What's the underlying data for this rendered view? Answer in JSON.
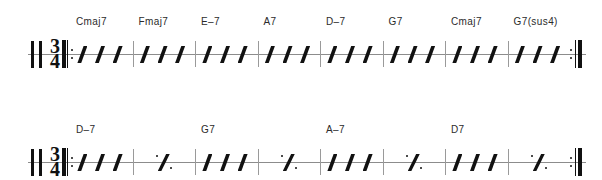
{
  "document": {
    "type": "chord-chart",
    "title": "",
    "clef": "rhythm-clef",
    "time_signature": {
      "numerator": "3",
      "denominator": "4"
    }
  },
  "colors": {
    "ink": "#111111",
    "staff_line": "#8c8c8c",
    "barline": "#9a9a9a",
    "chord_text": "#2b2b2b",
    "background": "#ffffff"
  },
  "systems": [
    {
      "name": "system-1",
      "start_repeat": true,
      "end_repeat": true,
      "measures": [
        {
          "chord": "Cmaj7",
          "content": "slashes",
          "beats": 3
        },
        {
          "chord": "Fmaj7",
          "content": "slashes",
          "beats": 3
        },
        {
          "chord": "E–7",
          "content": "slashes",
          "beats": 3
        },
        {
          "chord": "A7",
          "content": "slashes",
          "beats": 3
        },
        {
          "chord": "D–7",
          "content": "slashes",
          "beats": 3
        },
        {
          "chord": "G7",
          "content": "slashes",
          "beats": 3
        },
        {
          "chord": "Cmaj7",
          "content": "slashes",
          "beats": 3
        },
        {
          "chord": "G7(sus4)",
          "content": "slashes",
          "beats": 3
        }
      ]
    },
    {
      "name": "system-2",
      "start_repeat": true,
      "end_repeat": true,
      "measures": [
        {
          "chord": "D–7",
          "content": "slashes",
          "beats": 3
        },
        {
          "chord": "",
          "content": "simile",
          "beats": 3
        },
        {
          "chord": "G7",
          "content": "slashes",
          "beats": 3
        },
        {
          "chord": "",
          "content": "simile",
          "beats": 3
        },
        {
          "chord": "A–7",
          "content": "slashes",
          "beats": 3
        },
        {
          "chord": "",
          "content": "simile",
          "beats": 3
        },
        {
          "chord": "D7",
          "content": "slashes",
          "beats": 3
        },
        {
          "chord": "",
          "content": "simile",
          "beats": 3
        }
      ]
    }
  ]
}
